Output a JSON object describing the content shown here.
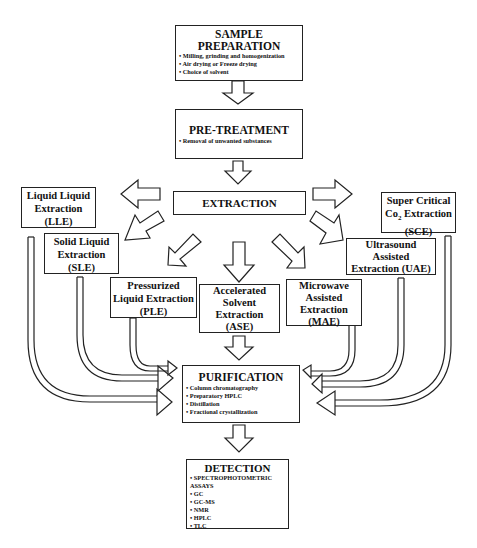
{
  "diagram": {
    "sample_preparation": {
      "title_line1": "SAMPLE",
      "title_line2": "PREPARATION",
      "items": [
        "Milling, grinding and homogenization",
        "Air drying or Freeze drying",
        "Choice of solvent"
      ]
    },
    "pre_treatment": {
      "title": "PRE-TREATMENT",
      "items": [
        "Removal of unwanted substances"
      ]
    },
    "extraction": {
      "title": "EXTRACTION"
    },
    "methods": {
      "lle": {
        "line1": "Liquid Liquid",
        "line2": "Extraction",
        "line3": "(LLE)"
      },
      "sle": {
        "line1": "Solid Liquid",
        "line2": "Extraction",
        "line3": "(SLE)"
      },
      "ple": {
        "line1": "Pressurized",
        "line2": "Liquid Extraction",
        "line3": "(PLE)"
      },
      "ase": {
        "line1": "Accelerated",
        "line2": "Solvent",
        "line3": "Extraction",
        "line4": "(ASE)"
      },
      "mae": {
        "line1": "Microwave",
        "line2": "Assisted",
        "line3": "Extraction",
        "line4": "(MAE)"
      },
      "uae": {
        "line1": "Ultrasound",
        "line2": "Assisted",
        "line3": "Extraction (UAE)"
      },
      "sce": {
        "line1": "Super Critical",
        "line2_pre": "Co",
        "line2_sub": "2",
        "line2_post": " Extraction",
        "line3": "(SCE)"
      }
    },
    "purification": {
      "title": "PURIFICATION",
      "items": [
        "Column chromatography",
        "Preparatory HPLC",
        "Distillation",
        "Fractional crystallization"
      ]
    },
    "detection": {
      "title": "DETECTION",
      "items": [
        "SPECTROPHOTOMETRIC ASSAYS",
        "GC",
        "GC-MS",
        "NMR",
        "HPLC",
        "TLC"
      ]
    }
  }
}
